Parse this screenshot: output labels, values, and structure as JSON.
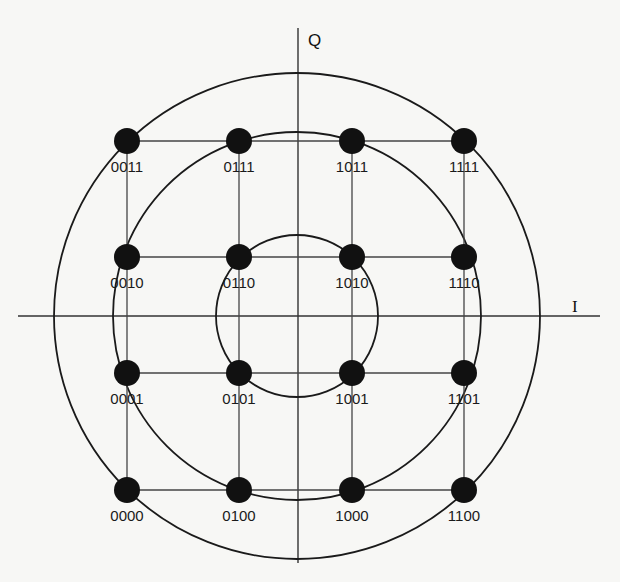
{
  "diagram": {
    "type": "16-QAM constellation",
    "axes": {
      "horizontal_label": "I",
      "vertical_label": "Q"
    },
    "rings": [
      "inner",
      "middle",
      "outer"
    ],
    "grid": {
      "columns_x": [
        127,
        239,
        352,
        464
      ],
      "rows_y": [
        141,
        257,
        373,
        490
      ]
    },
    "points": [
      {
        "label": "0011",
        "col": 0,
        "row": 0
      },
      {
        "label": "0111",
        "col": 1,
        "row": 0
      },
      {
        "label": "1011",
        "col": 2,
        "row": 0
      },
      {
        "label": "1111",
        "col": 3,
        "row": 0
      },
      {
        "label": "0010",
        "col": 0,
        "row": 1
      },
      {
        "label": "0110",
        "col": 1,
        "row": 1
      },
      {
        "label": "1010",
        "col": 2,
        "row": 1
      },
      {
        "label": "1110",
        "col": 3,
        "row": 1
      },
      {
        "label": "0001",
        "col": 0,
        "row": 2
      },
      {
        "label": "0101",
        "col": 1,
        "row": 2
      },
      {
        "label": "1001",
        "col": 2,
        "row": 2
      },
      {
        "label": "1101",
        "col": 3,
        "row": 2
      },
      {
        "label": "0000",
        "col": 0,
        "row": 3
      },
      {
        "label": "0100",
        "col": 1,
        "row": 3
      },
      {
        "label": "1000",
        "col": 2,
        "row": 3
      },
      {
        "label": "1100",
        "col": 3,
        "row": 3
      }
    ]
  }
}
